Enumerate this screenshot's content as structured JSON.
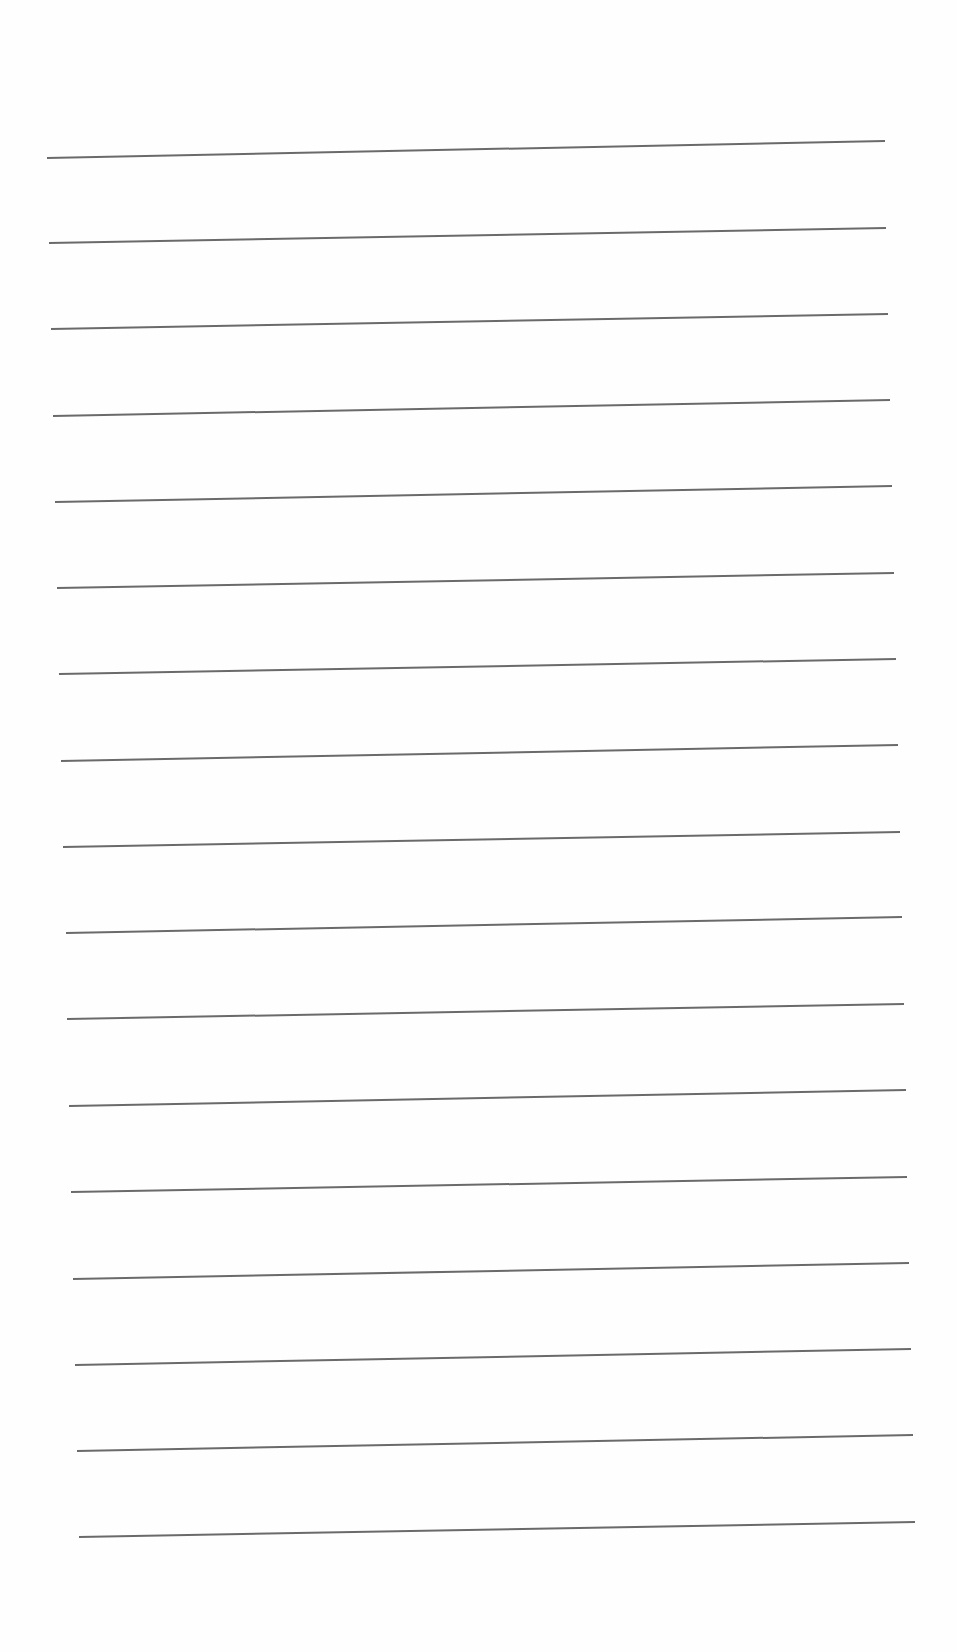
{
  "page": {
    "width": 957,
    "height": 1652,
    "background": "#fefefe",
    "line_color": "#6a6a6a",
    "line_width": 2
  },
  "ruled_lines": [
    {
      "x1": 47,
      "y1": 158,
      "x2": 885,
      "y2": 141
    },
    {
      "x1": 49,
      "y1": 243,
      "x2": 886,
      "y2": 228
    },
    {
      "x1": 51,
      "y1": 329,
      "x2": 888,
      "y2": 314
    },
    {
      "x1": 53,
      "y1": 416,
      "x2": 890,
      "y2": 400
    },
    {
      "x1": 55,
      "y1": 502,
      "x2": 892,
      "y2": 486
    },
    {
      "x1": 57,
      "y1": 588,
      "x2": 894,
      "y2": 573
    },
    {
      "x1": 59,
      "y1": 674,
      "x2": 896,
      "y2": 659
    },
    {
      "x1": 61,
      "y1": 761,
      "x2": 898,
      "y2": 745
    },
    {
      "x1": 63,
      "y1": 847,
      "x2": 900,
      "y2": 832
    },
    {
      "x1": 66,
      "y1": 933,
      "x2": 902,
      "y2": 917
    },
    {
      "x1": 67,
      "y1": 1019,
      "x2": 904,
      "y2": 1004
    },
    {
      "x1": 69,
      "y1": 1106,
      "x2": 906,
      "y2": 1090
    },
    {
      "x1": 71,
      "y1": 1192,
      "x2": 907,
      "y2": 1177
    },
    {
      "x1": 73,
      "y1": 1279,
      "x2": 909,
      "y2": 1263
    },
    {
      "x1": 75,
      "y1": 1365,
      "x2": 911,
      "y2": 1349
    },
    {
      "x1": 77,
      "y1": 1451,
      "x2": 913,
      "y2": 1435
    },
    {
      "x1": 79,
      "y1": 1537,
      "x2": 915,
      "y2": 1522
    }
  ]
}
